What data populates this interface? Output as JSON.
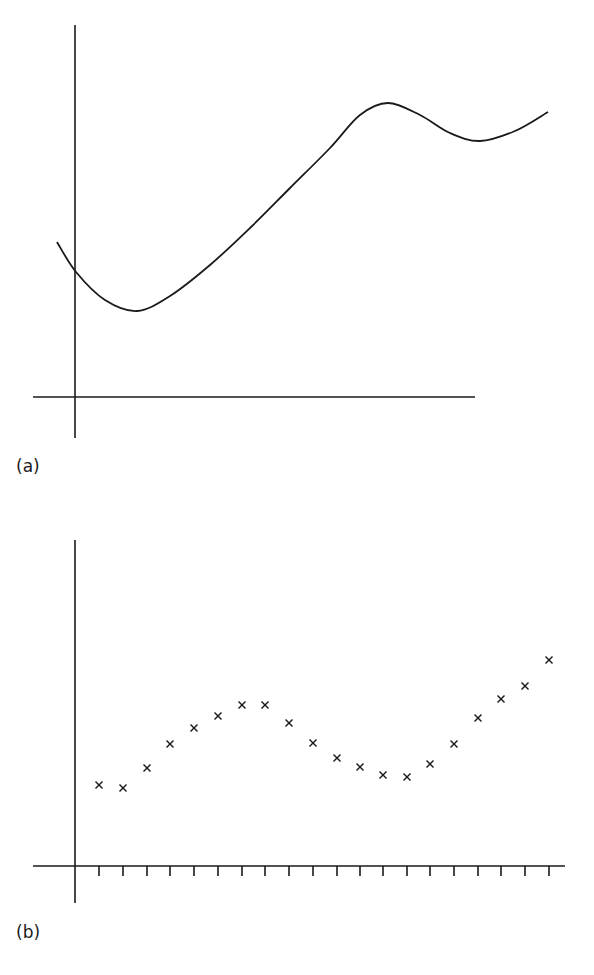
{
  "chart_data": [
    {
      "panel": "(a)",
      "type": "line",
      "title": "",
      "xlabel": "",
      "ylabel": "",
      "description": "Continuous smooth curve: starts left of y-axis, dips to a minimum, rises to a maximum, falls to a local minimum, then rises again",
      "grid": false,
      "x": [
        -0.5,
        0,
        1,
        2,
        3,
        4,
        5,
        6,
        7,
        8,
        9,
        10,
        11,
        12,
        13
      ],
      "y": [
        3.9,
        3.4,
        2.1,
        2.6,
        3.8,
        5.2,
        6.6,
        8.0,
        9.2,
        9.75,
        9.5,
        8.75,
        8.45,
        8.9,
        9.4
      ],
      "points_px": [
        [
          57,
          242
        ],
        [
          76,
          272
        ],
        [
          105,
          300
        ],
        [
          137,
          311
        ],
        [
          170,
          296
        ],
        [
          210,
          265
        ],
        [
          250,
          228
        ],
        [
          290,
          188
        ],
        [
          330,
          148
        ],
        [
          360,
          115
        ],
        [
          388,
          103
        ],
        [
          420,
          115
        ],
        [
          450,
          133
        ],
        [
          480,
          141
        ],
        [
          515,
          131
        ],
        [
          548,
          112
        ]
      ],
      "axes_px": {
        "origin": [
          75,
          397
        ],
        "x_axis": [
          33,
          475
        ],
        "y_axis": [
          25,
          438
        ]
      },
      "stroke": "#1a1a1a"
    },
    {
      "panel": "(b)",
      "type": "scatter",
      "title": "",
      "xlabel": "",
      "ylabel": "",
      "description": "Discrete sampled points (marked with x) at equally spaced ticks along the x-axis",
      "grid": false,
      "x": [
        1,
        2,
        3,
        4,
        5,
        6,
        7,
        8,
        9,
        10,
        11,
        12,
        13,
        14,
        15,
        16,
        17,
        18,
        19,
        20
      ],
      "y": [
        4.1,
        3.9,
        5.0,
        6.2,
        7.0,
        7.6,
        8.2,
        8.2,
        7.3,
        6.2,
        5.5,
        5.0,
        4.6,
        4.5,
        5.1,
        6.2,
        7.5,
        8.4,
        9.0,
        10.3
      ],
      "ticks": 20,
      "points_px": [
        [
          99,
          785
        ],
        [
          123,
          788
        ],
        [
          147,
          768
        ],
        [
          170,
          744
        ],
        [
          194,
          728
        ],
        [
          218,
          716
        ],
        [
          242,
          705
        ],
        [
          265,
          705
        ],
        [
          289,
          723
        ],
        [
          313,
          743
        ],
        [
          337,
          758
        ],
        [
          360,
          767
        ],
        [
          383,
          775
        ],
        [
          407,
          777
        ],
        [
          430,
          764
        ],
        [
          454,
          744
        ],
        [
          478,
          718
        ],
        [
          501,
          699
        ],
        [
          525,
          686
        ],
        [
          549,
          660
        ]
      ],
      "axes_px": {
        "origin": [
          75,
          866
        ],
        "x_axis": [
          33,
          565
        ],
        "y_axis": [
          540,
          903
        ]
      },
      "marker": "x",
      "stroke": "#1a1a1a"
    }
  ],
  "labels": {
    "panel_a": "(a)",
    "panel_b": "(b)"
  }
}
